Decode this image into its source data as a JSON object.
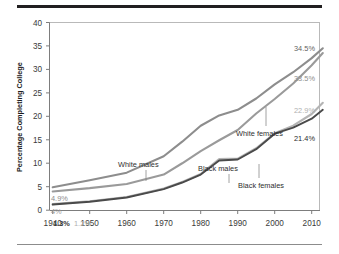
{
  "figure": {
    "name": "percentage-completing-college-chart"
  },
  "chart_data": {
    "type": "line",
    "title": "",
    "xlabel": "",
    "ylabel": "Percentage Completing College",
    "xlim": [
      1940,
      2013
    ],
    "ylim": [
      0,
      40
    ],
    "grid": false,
    "legend_position": "inline-annotations",
    "xticks": [
      "1940",
      "1950",
      "1960",
      "1970",
      "1980",
      "1990",
      "2000",
      "2010"
    ],
    "xtick_values": [
      1940,
      1950,
      1960,
      1970,
      1980,
      1990,
      2000,
      2010
    ],
    "yticks": [
      "0",
      "5",
      "10",
      "15",
      "20",
      "25",
      "30",
      "35",
      "40"
    ],
    "ytick_values": [
      0,
      5,
      10,
      15,
      20,
      25,
      30,
      35,
      40
    ],
    "x": [
      1940,
      1950,
      1960,
      1970,
      1975,
      1980,
      1985,
      1990,
      1995,
      2000,
      2005,
      2010,
      2013
    ],
    "series": [
      {
        "name": "White males",
        "color": "#8d8d8d",
        "start_label": "4.9%",
        "end_label": "34.5%",
        "values": [
          4.9,
          6.4,
          8.0,
          11.5,
          14.6,
          18.0,
          20.2,
          21.4,
          23.8,
          26.8,
          29.4,
          32.4,
          34.5
        ]
      },
      {
        "name": "White females",
        "color": "#9a9a9a",
        "start_label": "4%",
        "end_label": "33.5%",
        "values": [
          4.0,
          4.7,
          5.6,
          7.6,
          10.0,
          12.6,
          14.9,
          17.1,
          20.6,
          23.7,
          27.0,
          30.9,
          33.5
        ]
      },
      {
        "name": "Black males",
        "color": "#b4b4b4",
        "start_label": "1.3%",
        "end_label": "22.9%",
        "values": [
          1.3,
          1.9,
          2.8,
          4.6,
          6.0,
          7.7,
          10.9,
          11.0,
          13.2,
          16.4,
          18.0,
          20.5,
          22.9
        ]
      },
      {
        "name": "Black females",
        "color": "#4a4a4a",
        "start_label": "1.2%",
        "end_label": "21.4%",
        "values": [
          1.2,
          1.8,
          2.7,
          4.5,
          5.9,
          7.6,
          10.6,
          10.8,
          13.0,
          16.3,
          17.6,
          19.5,
          21.4
        ]
      }
    ],
    "annotations": [
      {
        "text": "White males",
        "color": "#2e2e2e"
      },
      {
        "text": "Black males",
        "color": "#2e2e2e"
      },
      {
        "text": "White females",
        "color": "#2e2e2e"
      },
      {
        "text": "Black females",
        "color": "#2e2e2e"
      }
    ],
    "start_labels": [
      {
        "text": "4.9%",
        "color": "#8d8d8d"
      },
      {
        "text": "4%",
        "color": "#9a9a9a"
      },
      {
        "text": "1.3%",
        "color": "#3a3a3a"
      },
      {
        "text": "1.2%",
        "color": "#b0b0b0"
      }
    ],
    "end_labels": [
      {
        "text": "34.5%",
        "color": "#5f5f5f"
      },
      {
        "text": "33.5%",
        "color": "#8d8d8d"
      },
      {
        "text": "22.9%",
        "color": "#b0b0b0"
      },
      {
        "text": "21.4%",
        "color": "#2b2b2b"
      }
    ]
  }
}
